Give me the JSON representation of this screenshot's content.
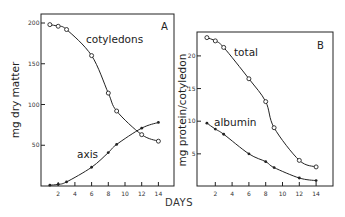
{
  "chart_data": [
    {
      "type": "line",
      "panel": "A",
      "title": "",
      "xlabel": "DAYS",
      "ylabel": "mg dry matter",
      "x_ticks": [
        2,
        4,
        6,
        8,
        10,
        12,
        14
      ],
      "y_ticks": [
        50,
        100,
        150,
        200
      ],
      "xlim": [
        0,
        15.5
      ],
      "ylim": [
        0,
        210
      ],
      "grid": false,
      "legend": "inline labels",
      "x": [
        1,
        2,
        3,
        6,
        8,
        9,
        12,
        14
      ],
      "series": [
        {
          "name": "cotyledons",
          "marker": "open-circle",
          "values": [
            198,
            196,
            192,
            160,
            114,
            92,
            63,
            55
          ]
        },
        {
          "name": "axis",
          "marker": "filled-dot",
          "values": [
            1,
            2,
            5,
            23,
            41,
            51,
            71,
            78
          ]
        }
      ]
    },
    {
      "type": "line",
      "panel": "B",
      "title": "",
      "xlabel": "DAYS",
      "ylabel": "mg protein/cotyledon",
      "x_ticks": [
        2,
        4,
        6,
        8,
        10,
        12,
        14
      ],
      "y_ticks": [
        5,
        10,
        15,
        20
      ],
      "xlim": [
        0,
        16
      ],
      "ylim": [
        0,
        23.5
      ],
      "grid": false,
      "legend": "inline labels",
      "x": [
        1,
        2,
        3,
        6,
        8,
        9,
        12,
        14
      ],
      "series": [
        {
          "name": "total",
          "marker": "open-circle",
          "values": [
            22.8,
            22.3,
            21.3,
            16.5,
            13.0,
            9.0,
            4.0,
            3.0
          ]
        },
        {
          "name": "albumin",
          "marker": "filled-dot",
          "values": [
            9.7,
            8.8,
            8.0,
            5.0,
            3.8,
            2.9,
            1.3,
            0.9
          ]
        }
      ]
    }
  ],
  "labels": {
    "panel_a": "A",
    "panel_b": "B",
    "ylabel_a": "mg dry matter",
    "ylabel_b": "mg protein/cotyledon",
    "xlabel": "DAYS",
    "series_a1": "cotyledons",
    "series_a2": "axis",
    "series_b1": "total",
    "series_b2": "albumin"
  },
  "colors": {
    "ink": "#222222",
    "background": "#ffffff"
  }
}
